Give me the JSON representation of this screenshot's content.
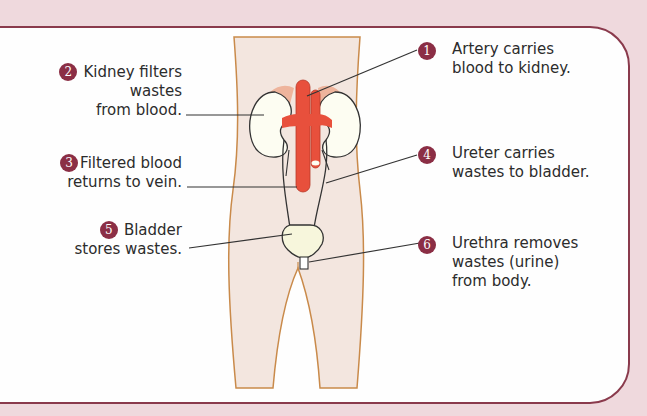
{
  "diagram": {
    "colors": {
      "background": "#efd9dd",
      "panel_border": "#8a3a4c",
      "badge": "#8b2e45",
      "body_fill": "#f3e6df",
      "body_outline": "#c98a4a",
      "blood_vessel": "#e8503c",
      "kidney": "#fdfdf2",
      "adrenal": "#eeb49c",
      "bladder": "#f7f6dc"
    },
    "labels": [
      {
        "number": "1",
        "text_lines": [
          "Artery carries",
          "blood to kidney."
        ],
        "points_to": "artery"
      },
      {
        "number": "2",
        "text_lines": [
          "Kidney filters",
          "wastes",
          "from blood."
        ],
        "points_to": "kidney"
      },
      {
        "number": "3",
        "text_lines": [
          "Filtered blood",
          "returns to vein."
        ],
        "points_to": "vein"
      },
      {
        "number": "4",
        "text_lines": [
          "Ureter carries",
          "wastes to bladder."
        ],
        "points_to": "ureter"
      },
      {
        "number": "5",
        "text_lines": [
          "Bladder",
          "stores wastes."
        ],
        "points_to": "bladder"
      },
      {
        "number": "6",
        "text_lines": [
          "Urethra removes",
          "wastes (urine)",
          "from body."
        ],
        "points_to": "urethra"
      }
    ]
  }
}
